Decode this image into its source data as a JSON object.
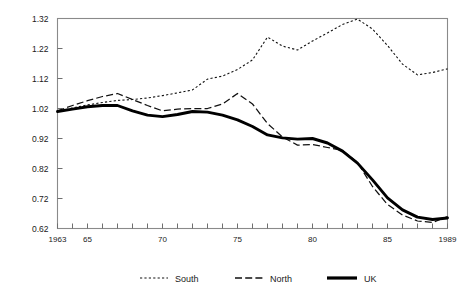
{
  "chart_data": {
    "type": "line",
    "title": "",
    "subtitle": "",
    "xlabel": "",
    "ylabel": "",
    "xlim": [
      1963,
      1989
    ],
    "ylim": [
      0.62,
      1.32
    ],
    "grid": false,
    "legend_position": "bottom",
    "x": [
      1963,
      1964,
      1965,
      1966,
      1967,
      1968,
      1969,
      1970,
      1971,
      1972,
      1973,
      1974,
      1975,
      1976,
      1977,
      1978,
      1979,
      1980,
      1981,
      1982,
      1983,
      1984,
      1985,
      1986,
      1987,
      1988,
      1989
    ],
    "y_ticks": [
      0.62,
      0.72,
      0.82,
      0.92,
      1.02,
      1.12,
      1.22,
      1.32
    ],
    "y_tick_labels": [
      "0.62",
      "0.72",
      "0.82",
      "0.92",
      "1.02",
      "1.12",
      "1.22",
      "1.32"
    ],
    "x_ticks": [
      1963,
      1965,
      1970,
      1975,
      1980,
      1985,
      1989
    ],
    "x_tick_labels": [
      "1963",
      "65",
      "70",
      "75",
      "80",
      "85",
      "1989"
    ],
    "series": [
      {
        "name": "South",
        "style": "dotted",
        "values": [
          1.01,
          1.022,
          1.032,
          1.04,
          1.047,
          1.05,
          1.055,
          1.063,
          1.072,
          1.082,
          1.118,
          1.128,
          1.15,
          1.182,
          1.258,
          1.228,
          1.215,
          1.245,
          1.272,
          1.3,
          1.318,
          1.285,
          1.23,
          1.168,
          1.132,
          1.14,
          1.152
        ]
      },
      {
        "name": "North",
        "style": "dashed",
        "values": [
          1.012,
          1.03,
          1.046,
          1.06,
          1.07,
          1.05,
          1.03,
          1.012,
          1.018,
          1.02,
          1.02,
          1.035,
          1.07,
          1.035,
          0.97,
          0.925,
          0.898,
          0.9,
          0.89,
          0.88,
          0.84,
          0.76,
          0.7,
          0.665,
          0.645,
          0.64,
          0.66
        ]
      },
      {
        "name": "UK",
        "style": "solid-thick",
        "values": [
          1.01,
          1.018,
          1.026,
          1.03,
          1.03,
          1.012,
          0.998,
          0.993,
          1.0,
          1.01,
          1.008,
          0.998,
          0.982,
          0.96,
          0.932,
          0.922,
          0.918,
          0.92,
          0.905,
          0.878,
          0.838,
          0.782,
          0.722,
          0.682,
          0.658,
          0.65,
          0.655
        ]
      }
    ]
  },
  "legend": {
    "items": [
      {
        "label": "South"
      },
      {
        "label": "North"
      },
      {
        "label": "UK"
      }
    ]
  }
}
